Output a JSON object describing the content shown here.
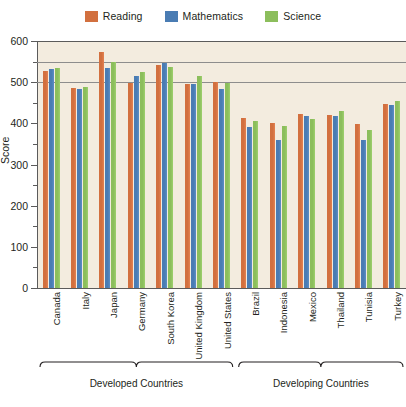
{
  "legend": {
    "entries": [
      {
        "label": "Reading",
        "color": "#d2703f",
        "icon": "legend-swatch-reading"
      },
      {
        "label": "Mathematics",
        "color": "#4a7cb3",
        "icon": "legend-swatch-mathematics"
      },
      {
        "label": "Science",
        "color": "#8cbe5c",
        "icon": "legend-swatch-science"
      }
    ]
  },
  "chart_data": {
    "type": "bar",
    "title": "",
    "xlabel": "",
    "ylabel": "Score",
    "ylim": [
      0,
      600
    ],
    "yticks": [
      0,
      100,
      200,
      300,
      400,
      500,
      600
    ],
    "ytick_labels": [
      "0",
      "100",
      "200",
      "300",
      "400",
      "500",
      "600"
    ],
    "minor_tick_step": 50,
    "gridlines": [
      500,
      550,
      600
    ],
    "grid": true,
    "legend_position": "top-center",
    "plot_background": "#f3ecdf",
    "categories": [
      "Canada",
      "Italy",
      "Japan",
      "Germany",
      "South Korea",
      "United Kingdom",
      "United States",
      "Brazil",
      "Indonesia",
      "Mexico",
      "Thailand",
      "Tunisia",
      "Turkey"
    ],
    "series": [
      {
        "name": "Reading",
        "color": "#d2703f",
        "values": [
          527,
          487,
          573,
          497,
          541,
          496,
          500,
          412,
          402,
          422,
          421,
          398,
          448
        ]
      },
      {
        "name": "Mathematics",
        "color": "#4a7cb3",
        "values": [
          532,
          483,
          534,
          516,
          547,
          495,
          483,
          390,
          360,
          419,
          417,
          359,
          445
        ]
      },
      {
        "name": "Science",
        "color": "#8cbe5c",
        "values": [
          534,
          489,
          548,
          524,
          538,
          515,
          499,
          405,
          393,
          410,
          429,
          385,
          454
        ]
      }
    ],
    "groups": [
      {
        "label": "Developed Countries",
        "from": "Canada",
        "to": "United States",
        "start_index": 0,
        "end_index": 6
      },
      {
        "label": "Developing Countries",
        "from": "Brazil",
        "to": "Turkey",
        "start_index": 7,
        "end_index": 12
      }
    ]
  }
}
